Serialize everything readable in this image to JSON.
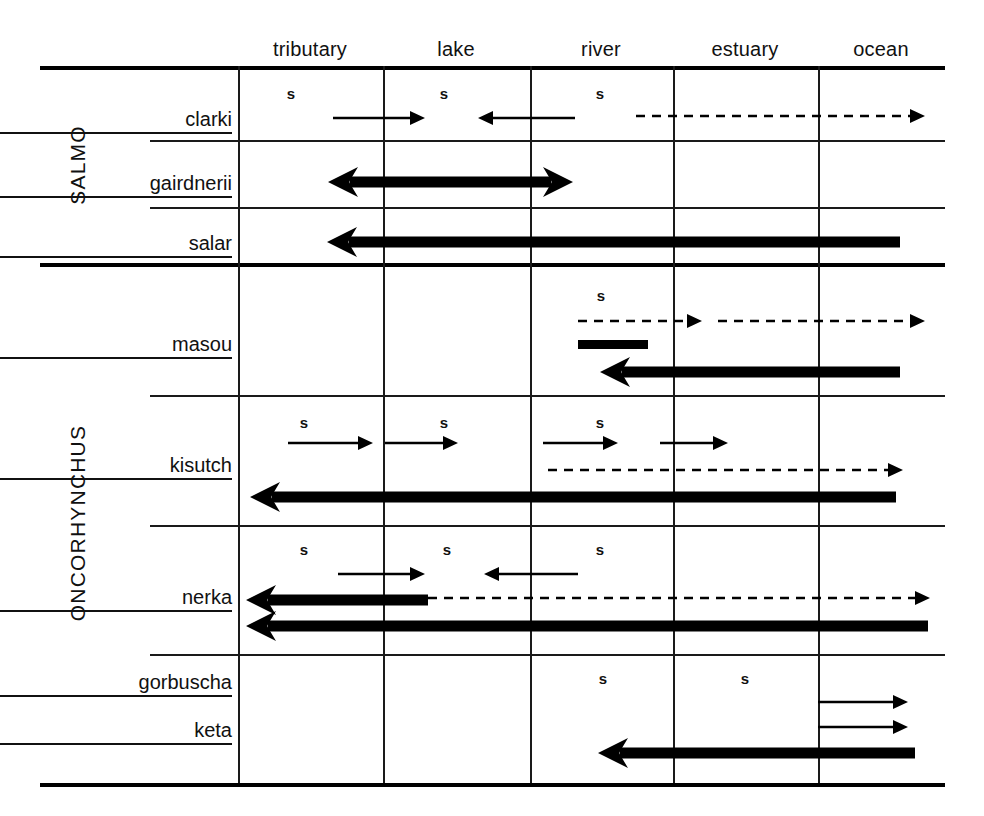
{
  "figure": {
    "type": "habitat-migration-matrix",
    "background": "#ffffff",
    "ink": "#111111"
  },
  "columns": [
    {
      "key": "tributary",
      "label": "tributary",
      "center": 310,
      "x_start": 238,
      "x_end": 383
    },
    {
      "key": "lake",
      "label": "lake",
      "center": 456,
      "x_start": 383,
      "x_end": 530
    },
    {
      "key": "river",
      "label": "river",
      "center": 601,
      "x_start": 530,
      "x_end": 673
    },
    {
      "key": "estuary",
      "label": "estuary",
      "center": 745,
      "x_start": 673,
      "x_end": 818
    },
    {
      "key": "ocean",
      "label": "ocean",
      "center": 881,
      "x_start": 818,
      "x_end": 945
    }
  ],
  "genera": [
    {
      "key": "salmo",
      "label": "SALMO",
      "y_top": 66,
      "y_bottom": 263
    },
    {
      "key": "oncorhynchus",
      "label": "ONCORHYNCHUS",
      "y_top": 263,
      "y_bottom": 783
    }
  ],
  "species": [
    {
      "key": "clarki",
      "label": "clarki",
      "genus": "salmo",
      "label_y": 122
    },
    {
      "key": "gairdnerii",
      "label": "gairdnerii",
      "genus": "salmo",
      "label_y": 186
    },
    {
      "key": "salar",
      "label": "salar",
      "genus": "salmo",
      "label_y": 246
    },
    {
      "key": "masou",
      "label": "masou",
      "genus": "oncorhynchus",
      "label_y": 347
    },
    {
      "key": "kisutch",
      "label": "kisutch",
      "genus": "oncorhynchus",
      "label_y": 468
    },
    {
      "key": "nerka",
      "label": "nerka",
      "genus": "oncorhynchus",
      "label_y": 600
    },
    {
      "key": "gorbuscha",
      "label": "gorbuscha",
      "genus": "oncorhynchus",
      "label_y": 685
    },
    {
      "key": "keta",
      "label": "keta",
      "genus": "oncorhynchus",
      "label_y": 733
    }
  ],
  "spawning_marks": [
    {
      "species": "clarki",
      "column": "tributary",
      "label": "s",
      "x": 291,
      "y": 93
    },
    {
      "species": "clarki",
      "column": "lake",
      "label": "s",
      "x": 444,
      "y": 93
    },
    {
      "species": "clarki",
      "column": "river",
      "label": "s",
      "x": 600,
      "y": 93
    },
    {
      "species": "masou",
      "column": "river",
      "label": "s",
      "x": 601,
      "y": 295
    },
    {
      "species": "kisutch",
      "column": "tributary",
      "label": "s",
      "x": 304,
      "y": 422
    },
    {
      "species": "kisutch",
      "column": "lake",
      "label": "s",
      "x": 444,
      "y": 422
    },
    {
      "species": "kisutch",
      "column": "river",
      "label": "s",
      "x": 600,
      "y": 422
    },
    {
      "species": "nerka",
      "column": "tributary",
      "label": "s",
      "x": 304,
      "y": 549
    },
    {
      "species": "nerka",
      "column": "lake",
      "label": "s",
      "x": 447,
      "y": 549
    },
    {
      "species": "nerka",
      "column": "river",
      "label": "s",
      "x": 600,
      "y": 549
    },
    {
      "species": "gorbuscha",
      "column": "river",
      "label": "s",
      "x": 603,
      "y": 678
    },
    {
      "species": "gorbuscha",
      "column": "estuary",
      "label": "s",
      "x": 745,
      "y": 678
    }
  ],
  "arrows": [
    {
      "species": "clarki",
      "style": "thin",
      "direction": "right",
      "x1": 333,
      "x2": 425,
      "y": 118
    },
    {
      "species": "clarki",
      "style": "thin",
      "direction": "left",
      "x1": 575,
      "x2": 478,
      "y": 118
    },
    {
      "species": "clarki",
      "style": "dashed",
      "direction": "right",
      "x1": 636,
      "x2": 925,
      "y": 116
    },
    {
      "species": "gairdnerii",
      "style": "heavy",
      "direction": "both",
      "x1": 328,
      "x2": 573,
      "y": 182
    },
    {
      "species": "salar",
      "style": "heavy",
      "direction": "left",
      "x1": 900,
      "x2": 327,
      "y": 242
    },
    {
      "species": "masou",
      "style": "dashed",
      "direction": "right",
      "x1": 578,
      "x2": 702,
      "y": 321
    },
    {
      "species": "masou",
      "style": "dashed",
      "direction": "right",
      "x1": 718,
      "x2": 925,
      "y": 321
    },
    {
      "species": "masou",
      "style": "heavy",
      "direction": "left",
      "x1": 900,
      "x2": 600,
      "y": 372
    },
    {
      "species": "kisutch",
      "style": "thin",
      "direction": "right",
      "x1": 288,
      "x2": 373,
      "y": 443
    },
    {
      "species": "kisutch",
      "style": "thin",
      "direction": "right",
      "x1": 385,
      "x2": 458,
      "y": 443
    },
    {
      "species": "kisutch",
      "style": "thin",
      "direction": "right",
      "x1": 543,
      "x2": 618,
      "y": 443
    },
    {
      "species": "kisutch",
      "style": "thin",
      "direction": "right",
      "x1": 660,
      "x2": 728,
      "y": 443
    },
    {
      "species": "kisutch",
      "style": "dashed",
      "direction": "right",
      "x1": 548,
      "x2": 903,
      "y": 470
    },
    {
      "species": "kisutch",
      "style": "heavy",
      "direction": "left",
      "x1": 896,
      "x2": 250,
      "y": 497
    },
    {
      "species": "nerka",
      "style": "thin",
      "direction": "right",
      "x1": 338,
      "x2": 425,
      "y": 574
    },
    {
      "species": "nerka",
      "style": "thin",
      "direction": "left",
      "x1": 578,
      "x2": 484,
      "y": 574
    },
    {
      "species": "nerka",
      "style": "heavy",
      "direction": "left",
      "x1": 428,
      "x2": 246,
      "y": 600
    },
    {
      "species": "nerka",
      "style": "dashed",
      "direction": "right",
      "x1": 428,
      "x2": 930,
      "y": 598
    },
    {
      "species": "nerka",
      "style": "heavy",
      "direction": "left",
      "x1": 928,
      "x2": 246,
      "y": 626
    },
    {
      "species": "gorbuscha",
      "style": "thin",
      "direction": "right",
      "x1": 818,
      "x2": 908,
      "y": 702
    },
    {
      "species": "keta",
      "style": "thin",
      "direction": "right",
      "x1": 818,
      "x2": 908,
      "y": 727
    },
    {
      "species": "keta",
      "style": "heavy",
      "direction": "left",
      "x1": 915,
      "x2": 598,
      "y": 753
    }
  ],
  "bars": [
    {
      "species": "masou",
      "x1": 578,
      "x2": 648,
      "y": 344,
      "thickness": 9
    }
  ],
  "grid": {
    "x_left": 40,
    "x_right": 945,
    "vlines": [
      238,
      383,
      530,
      673,
      818
    ],
    "vline_top": 66,
    "vline_bottom": 783,
    "hlines": [
      {
        "y": 66,
        "x1": 40,
        "x2": 945,
        "weight": "thick"
      },
      {
        "y": 140,
        "x1": 150,
        "x2": 945,
        "weight": "thin"
      },
      {
        "y": 207,
        "x1": 150,
        "x2": 945,
        "weight": "thin"
      },
      {
        "y": 263,
        "x1": 40,
        "x2": 945,
        "weight": "thick"
      },
      {
        "y": 395,
        "x1": 150,
        "x2": 945,
        "weight": "thin"
      },
      {
        "y": 525,
        "x1": 150,
        "x2": 945,
        "weight": "thin"
      },
      {
        "y": 654,
        "x1": 150,
        "x2": 945,
        "weight": "thin"
      },
      {
        "y": 783,
        "x1": 40,
        "x2": 945,
        "weight": "thick"
      }
    ]
  }
}
